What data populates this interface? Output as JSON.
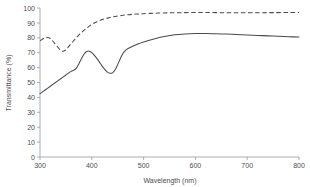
{
  "chart_data": {
    "type": "line",
    "title": "",
    "xlabel": "Wavelength (nm)",
    "ylabel": "Transmittance (%)",
    "xlim": [
      300,
      800
    ],
    "ylim": [
      0,
      100
    ],
    "xticks": [
      300,
      400,
      500,
      600,
      700,
      800
    ],
    "yticks": [
      0,
      10,
      20,
      30,
      40,
      50,
      60,
      70,
      80,
      90,
      100
    ],
    "grid": false,
    "legend_position": "none",
    "series": [
      {
        "name": "dashed-curve",
        "style": "dashed",
        "color": "#4a4a4a",
        "x": [
          300,
          310,
          320,
          330,
          340,
          345,
          350,
          360,
          370,
          380,
          390,
          400,
          410,
          420,
          430,
          440,
          450,
          460,
          470,
          480,
          490,
          500,
          520,
          540,
          560,
          580,
          600,
          620,
          640,
          660,
          680,
          700,
          720,
          740,
          760,
          780,
          800
        ],
        "y": [
          78.0,
          80.0,
          79.5,
          75.5,
          71.5,
          71.0,
          72.0,
          76.0,
          80.0,
          83.5,
          86.5,
          89.0,
          90.8,
          92.2,
          93.2,
          94.0,
          94.6,
          95.1,
          95.5,
          95.8,
          96.0,
          96.2,
          96.5,
          96.7,
          96.8,
          96.9,
          97.0,
          97.0,
          96.9,
          96.8,
          96.8,
          96.8,
          96.8,
          96.9,
          96.9,
          97.0,
          97.0
        ]
      },
      {
        "name": "solid-curve",
        "style": "solid",
        "color": "#4a4a4a",
        "x": [
          300,
          310,
          320,
          330,
          340,
          350,
          360,
          365,
          370,
          375,
          380,
          385,
          390,
          395,
          400,
          405,
          410,
          415,
          420,
          425,
          430,
          435,
          440,
          445,
          450,
          455,
          460,
          465,
          470,
          480,
          490,
          500,
          520,
          540,
          560,
          580,
          600,
          620,
          640,
          660,
          680,
          700,
          720,
          740,
          760,
          780,
          800
        ],
        "y": [
          42.5,
          45.0,
          47.5,
          50.0,
          52.5,
          55.0,
          57.5,
          58.2,
          59.5,
          62.5,
          66.0,
          69.0,
          70.8,
          71.0,
          70.0,
          68.2,
          66.0,
          63.5,
          61.0,
          58.8,
          57.0,
          56.2,
          56.5,
          58.5,
          62.0,
          66.0,
          69.5,
          71.5,
          72.8,
          74.5,
          76.0,
          77.2,
          79.2,
          80.8,
          82.0,
          82.6,
          82.9,
          82.9,
          82.7,
          82.5,
          82.2,
          81.9,
          81.6,
          81.3,
          81.0,
          80.7,
          80.5
        ]
      }
    ]
  },
  "axes": {
    "x_tick_labels": [
      "300",
      "400",
      "500",
      "600",
      "700",
      "800"
    ],
    "y_tick_labels": [
      "0",
      "10",
      "20",
      "30",
      "40",
      "50",
      "60",
      "70",
      "80",
      "90",
      "100"
    ],
    "x_axis_title": "Wavelength (nm)",
    "y_axis_title": "Transmittance (%)"
  },
  "colors": {
    "axis": "#9a9a9a",
    "text": "#4d4d4d",
    "series": "#4a4a4a",
    "background": "#ffffff"
  }
}
